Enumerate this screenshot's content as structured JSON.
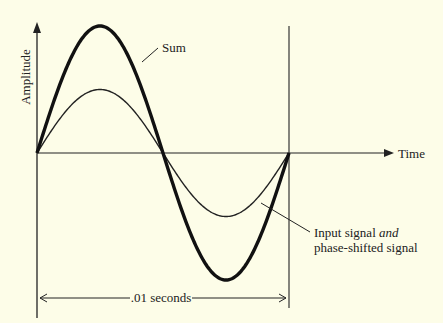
{
  "labels": {
    "y_axis": "Amplitude",
    "x_axis": "Time",
    "sum": "Sum",
    "input_line1_prefix": "Input signal ",
    "input_line1_italic": "and",
    "input_line2": "phase-shifted signal",
    "period": ".01 seconds"
  },
  "colors": {
    "background": "#fdfde8",
    "ink": "#222222"
  },
  "chart_data": {
    "type": "line",
    "title": "",
    "xlabel": "Time",
    "ylabel": "Amplitude",
    "period_label": ".01 seconds",
    "series": [
      {
        "name": "Input signal and phase-shifted signal",
        "relative_amplitude": 1,
        "shape": "sine, one full cycle",
        "x": [
          0,
          0.25,
          0.5,
          0.75,
          1
        ],
        "values": [
          0,
          1,
          0,
          -1,
          0
        ]
      },
      {
        "name": "Sum",
        "relative_amplitude": 2,
        "shape": "sine, one full cycle",
        "x": [
          0,
          0.25,
          0.5,
          0.75,
          1
        ],
        "values": [
          0,
          2,
          0,
          -2,
          0
        ]
      }
    ],
    "annotations": [
      "Sum",
      "Input signal and phase-shifted signal",
      ".01 seconds"
    ]
  }
}
